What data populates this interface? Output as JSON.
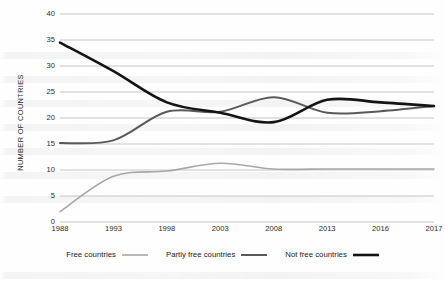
{
  "chart_data": {
    "type": "line",
    "title": "",
    "xlabel": "",
    "ylabel": "NUMBER OF COUNTRIES",
    "x": [
      "1988",
      "1993",
      "1998",
      "2003",
      "2008",
      "2013",
      "2016",
      "2017"
    ],
    "categories": [
      "1988",
      "1993",
      "1998",
      "2003",
      "2008",
      "2013",
      "2016",
      "2017"
    ],
    "ylim": [
      0,
      40
    ],
    "yticks": [
      0,
      5,
      10,
      15,
      20,
      25,
      30,
      35,
      40
    ],
    "ytick_labels": [
      "0",
      "5",
      "10",
      "15",
      "20",
      "25",
      "30",
      "35",
      "40"
    ],
    "grid": "horizontal",
    "legend_position": "bottom",
    "series": [
      {
        "name": "Free countries",
        "color": "#a8a8a8",
        "width": 1.6,
        "values": [
          2.0,
          8.8,
          9.8,
          11.3,
          10.2,
          10.2,
          10.2,
          10.2
        ]
      },
      {
        "name": "Partly free countries",
        "color": "#5a5a5a",
        "width": 2.0,
        "values": [
          15.2,
          15.7,
          21.2,
          21.2,
          24.0,
          21.0,
          21.3,
          22.3
        ]
      },
      {
        "name": "Not free countries",
        "color": "#141414",
        "width": 2.6,
        "values": [
          34.5,
          29.0,
          23.0,
          21.0,
          19.2,
          23.5,
          23.0,
          22.3
        ]
      }
    ]
  },
  "legend": {
    "items": [
      {
        "label": "Free countries"
      },
      {
        "label": "Partly free countries"
      },
      {
        "label": "Not free countries"
      }
    ]
  }
}
